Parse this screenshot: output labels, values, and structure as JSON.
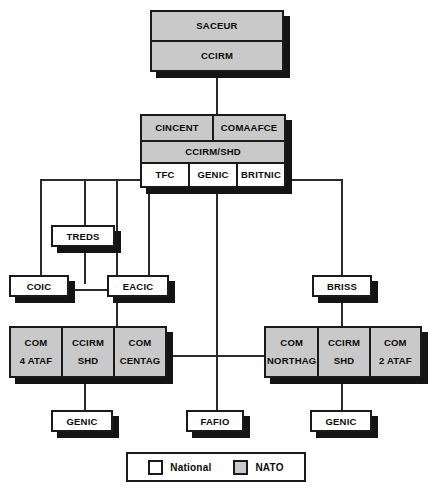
{
  "diagram": {
    "caption_fragment": "",
    "colors": {
      "nato_fill": "#c9c9c9",
      "national_fill": "#ffffff",
      "outline": "#1a1a1a",
      "shadow": "#141414",
      "line": "#2b2b2b",
      "background": "#ffffff"
    }
  },
  "nodes": {
    "saceur": {
      "rows": [
        {
          "cells": [
            {
              "main": "SACEUR",
              "sub": ""
            }
          ]
        },
        {
          "cells": [
            {
              "main": "CCIRM",
              "sub": ""
            }
          ]
        }
      ],
      "type": "NATO"
    },
    "cincent_group": {
      "rows": [
        {
          "cells": [
            {
              "main": "CINCENT",
              "sub": ""
            },
            {
              "main": "COMAAFCE",
              "sub": ""
            }
          ]
        },
        {
          "cells": [
            {
              "main": "CCIRM/SHD",
              "sub": ""
            }
          ]
        },
        {
          "cells": [
            {
              "main": "TFC",
              "sub": ""
            },
            {
              "main": "GENIC",
              "sub": ""
            },
            {
              "main": "BRITNIC",
              "sub": ""
            }
          ]
        }
      ],
      "type": "mixed"
    },
    "treds": {
      "label": "TREDS",
      "type": "National"
    },
    "coic": {
      "label": "COIC",
      "type": "National"
    },
    "eacic": {
      "label": "EACIC",
      "type": "National"
    },
    "briss": {
      "label": "BRISS",
      "type": "National"
    },
    "centag_group": {
      "cells": [
        {
          "main": "COM",
          "sub": "4 ATAF"
        },
        {
          "main": "CCIRM",
          "sub": "SHD"
        },
        {
          "main": "COM",
          "sub": "CENTAG"
        }
      ],
      "type": "NATO"
    },
    "northag_group": {
      "cells": [
        {
          "main": "COM",
          "sub": "NORTHAG"
        },
        {
          "main": "CCIRM",
          "sub": "SHD"
        },
        {
          "main": "COM",
          "sub": "2 ATAF"
        }
      ],
      "type": "NATO"
    },
    "genic_left": {
      "label": "GENIC",
      "type": "National"
    },
    "fafio": {
      "label": "FAFIO",
      "type": "National"
    },
    "genic_right": {
      "label": "GENIC",
      "type": "National"
    }
  },
  "legend": {
    "entries": [
      {
        "label": "National",
        "fill": "#ffffff"
      },
      {
        "label": "NATO",
        "fill": "#c9c9c9"
      }
    ]
  }
}
